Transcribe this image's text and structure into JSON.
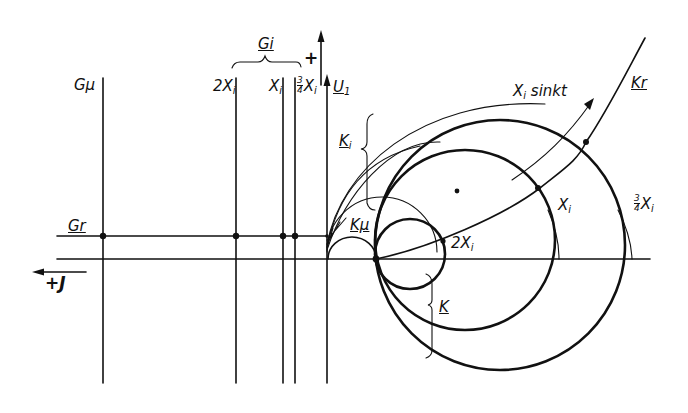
{
  "diagram": {
    "type": "circle-diagram (Ortskurven)",
    "labels": {
      "g_mu": "Gμ",
      "g_i_group": "Gi",
      "line_2xi_main": "2X",
      "line_2xi_sub": "i",
      "line_xi_main": "X",
      "line_xi_sub": "i",
      "line_34xi_num": "3",
      "line_34xi_den": "4",
      "line_34xi_main": "X",
      "line_34xi_sub": "i",
      "u1_main": "U",
      "u1_sub": "1",
      "plus_sign": "+",
      "g_r": "Gr",
      "plus_j": "+J",
      "k_i_main": "K",
      "k_i_sub": "i",
      "k_mu": "Kμ",
      "k": "K",
      "k_r": "Kr",
      "xi_sinkt_main": "X",
      "xi_sinkt_sub": "i",
      "xi_sinkt_text": " sinkt",
      "circle_2xi_main": "2X",
      "circle_2xi_sub": "i",
      "circle_xi_main": "X",
      "circle_xi_sub": "i",
      "circle_34xi_num": "3",
      "circle_34xi_den": "4",
      "circle_34xi_main": "X",
      "circle_34xi_sub": "i"
    },
    "vertical_lines": [
      {
        "name": "G_mu",
        "x": 103
      },
      {
        "name": "2X_i",
        "x": 236
      },
      {
        "name": "X_i",
        "x": 283
      },
      {
        "name": "3/4 X_i",
        "x": 295
      },
      {
        "name": "U_1 axis",
        "x": 327
      }
    ],
    "circles": [
      {
        "name": "K (2X_i)",
        "cx": 410,
        "cy": 254,
        "r": 35
      },
      {
        "name": "X_i",
        "cx": 465,
        "cy": 240,
        "r": 90
      },
      {
        "name": "3/4 X_i",
        "cx": 500,
        "cy": 245,
        "r": 125
      },
      {
        "name": "K_mu outer",
        "cx": 382,
        "cy": 252,
        "r": 55
      }
    ],
    "colors": {
      "ink": "#111111",
      "paper": "#ffffff"
    }
  }
}
